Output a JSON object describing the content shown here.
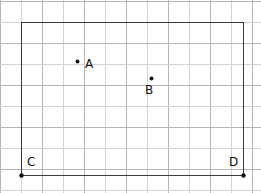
{
  "figure": {
    "width": 261,
    "height": 193,
    "background": "#ffffff"
  },
  "grid": {
    "cell_size": 21,
    "origin_x": 0,
    "origin_y": 1,
    "vertical_lines": 13,
    "horizontal_lines": 10,
    "line_color": "#d3d3d3",
    "line_color_strong": "#b5b5b5",
    "line_width": 1
  },
  "rectangle": {
    "name": "rectangle-ABCD",
    "left": 21,
    "top": 22,
    "right": 243,
    "bottom": 175,
    "width": 222,
    "height": 153,
    "stroke": "#3a3a3a",
    "stroke_width": 1.6,
    "fill": "none"
  },
  "points": [
    {
      "id": "A",
      "label": "A",
      "x": 77,
      "y": 61,
      "dot_radius": 2,
      "color": "#111111",
      "label_x": 85,
      "label_y": 58,
      "label_position": "right"
    },
    {
      "id": "B",
      "label": "B",
      "x": 151,
      "y": 78,
      "dot_radius": 2,
      "color": "#111111",
      "label_x": 145,
      "label_y": 84,
      "label_position": "below"
    },
    {
      "id": "C",
      "label": "C",
      "x": 21,
      "y": 175,
      "dot_radius": 2.2,
      "color": "#111111",
      "label_x": 27,
      "label_y": 156,
      "label_position": "above-right"
    },
    {
      "id": "D",
      "label": "D",
      "x": 243,
      "y": 175,
      "dot_radius": 2.2,
      "color": "#111111",
      "label_x": 229,
      "label_y": 156,
      "label_position": "above-left"
    }
  ],
  "chart_data": {
    "type": "scatter",
    "title": "",
    "xlabel": "",
    "ylabel": "",
    "grid": true,
    "legend": false,
    "grid_units": {
      "cell_size_px": 21,
      "note": "Coordinates below are expressed in grid cells measured from point C (bottom-left corner of the rectangle), x to the right and y upward."
    },
    "x": [
      2.7,
      6.2,
      0,
      10.6
    ],
    "y": [
      5.4,
      4.6,
      0,
      0
    ],
    "labels": [
      "A",
      "B",
      "C",
      "D"
    ],
    "annotations": [
      "Rectangle spans 10.6 grid cells wide and 7.3 grid cells tall",
      "C is the bottom-left vertex of the rectangle",
      "D is the bottom-right vertex of the rectangle",
      "A and B are interior points of the rectangle"
    ],
    "xlim": [
      0,
      12.4
    ],
    "ylim": [
      0,
      9.1
    ]
  }
}
